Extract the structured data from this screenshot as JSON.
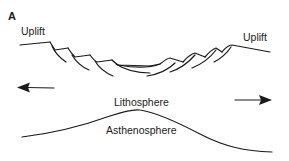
{
  "figure": {
    "panel_label": "A",
    "labels": {
      "uplift_left": "Uplift",
      "uplift_right": "Uplift",
      "lithosphere": "Lithosphere",
      "asthenosphere": "Asthenosphere"
    },
    "arrows": [
      {
        "direction": "left",
        "meaning": "extension"
      },
      {
        "direction": "right",
        "meaning": "extension"
      }
    ],
    "colors": {
      "ink": "#1a1a1a",
      "background": "#ffffff"
    }
  }
}
